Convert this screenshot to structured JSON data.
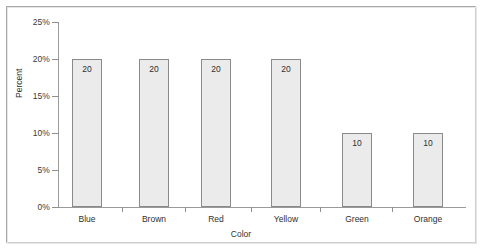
{
  "chart_data": {
    "type": "bar",
    "title": "",
    "subtitle": "",
    "xlabel": "Color",
    "ylabel": "Percent",
    "categories": [
      "Blue",
      "Brown",
      "Red",
      "Yellow",
      "Green",
      "Orange"
    ],
    "values": [
      20,
      20,
      20,
      20,
      10,
      10
    ],
    "data_labels": [
      "20",
      "20",
      "20",
      "20",
      "10",
      "10"
    ],
    "ylim": [
      0,
      25
    ],
    "y_ticks": [
      0,
      5,
      10,
      15,
      20,
      25
    ],
    "y_tick_labels": [
      "0%",
      "5%",
      "10%",
      "15%",
      "20%",
      "25%"
    ],
    "grid": false,
    "legend": false,
    "legend_position": "none",
    "bar_fill_color": "#ebebeb",
    "bar_border_color": "#8a8a8a",
    "axis_color": "#9a9a9a",
    "text_color": "#2f2f2f",
    "background_color": "#ffffff"
  },
  "frame": {
    "border_color": "#b9b9b9"
  }
}
